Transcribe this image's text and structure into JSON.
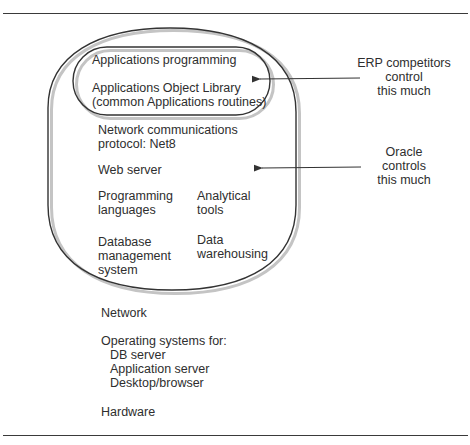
{
  "diagram": {
    "inner_box": {
      "line1": "Applications programming",
      "line2": "Applications Object Library",
      "line3": "(common Applications routines)"
    },
    "outer_box": {
      "net_line1": "Network communications",
      "net_line2": "protocol: Net8",
      "web_server": "Web server",
      "prog_line1": "Programming",
      "prog_line2": "languages",
      "analytical_line1": "Analytical",
      "analytical_line2": "tools",
      "db_line1": "Database",
      "db_line2": "management",
      "db_line3": "system",
      "dw_line1": "Data",
      "dw_line2": "warehousing"
    },
    "below": {
      "network": "Network",
      "os_title": "Operating systems for:",
      "os_items": [
        "DB server",
        "Application server",
        "Desktop/browser"
      ],
      "hardware": "Hardware"
    },
    "annotations": {
      "erp": [
        "ERP competitors",
        "control",
        "this much"
      ],
      "oracle": [
        "Oracle",
        "controls",
        "this much"
      ]
    },
    "colors": {
      "line": "#333333",
      "text": "#2e2e2e",
      "shadow": "#bdbdbd"
    }
  }
}
